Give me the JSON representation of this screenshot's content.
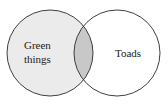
{
  "diagram": {
    "type": "venn",
    "sets": [
      {
        "label_line1": "Green",
        "label_line2": "things",
        "fill": "#ebebeb"
      },
      {
        "label": "Toads",
        "fill": "#ffffff"
      }
    ],
    "intersection_fill": "#c8c8c8",
    "stroke": "#2a2a2a"
  }
}
